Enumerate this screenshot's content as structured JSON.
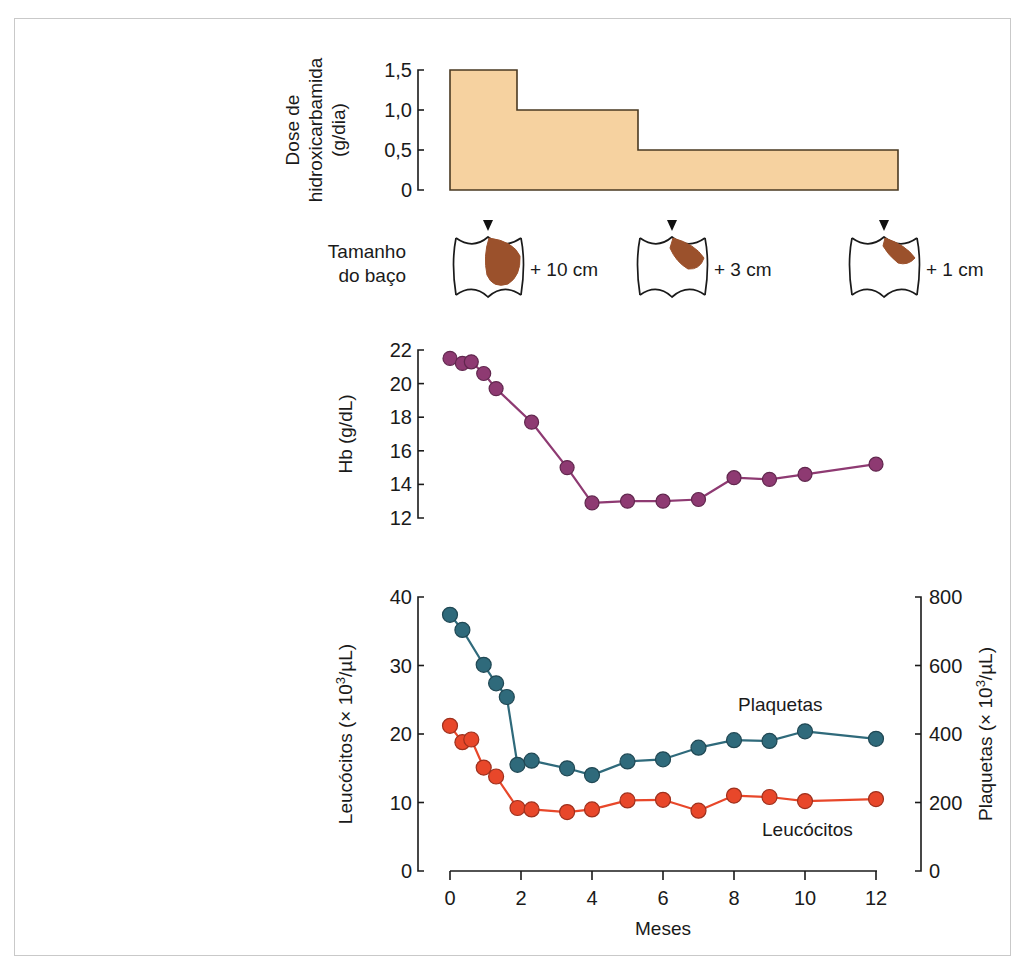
{
  "figure": {
    "x_axis": {
      "label": "Meses",
      "ticks": [
        0,
        2,
        4,
        6,
        8,
        10,
        12
      ],
      "tick_labels": [
        "0",
        "2",
        "4",
        "6",
        "8",
        "10",
        "12"
      ],
      "min": 0,
      "max": 12
    },
    "dose_panel": {
      "axis_label_line1": "Dose de",
      "axis_label_line2": "hidroxicarbamida",
      "axis_label_line3": "(g/dia)",
      "tick_labels": [
        "1,5",
        "1,0",
        "0,5",
        "0"
      ],
      "tick_values": [
        1.5,
        1.0,
        0.5,
        0
      ],
      "fill_color": "#f6d2a0",
      "stroke_color": "#4a3a22",
      "steps": [
        {
          "x_start": 0,
          "x_end": 1.9,
          "dose": 1.5
        },
        {
          "x_start": 1.9,
          "x_end": 5.3,
          "dose": 1.0
        },
        {
          "x_start": 5.3,
          "x_end": 12.6,
          "dose": 0.5
        }
      ]
    },
    "spleen_panel": {
      "label_line1": "Tamanho",
      "label_line2": "do baço",
      "spleen_color": "#9b512c",
      "outline_color": "#1a1a1a",
      "markers": [
        {
          "month": 1.9,
          "size_text": "+ 10 cm",
          "severity": "large"
        },
        {
          "month": 7.2,
          "size_text": "+ 3 cm",
          "severity": "medium"
        },
        {
          "month": 12.0,
          "size_text": "+ 1 cm",
          "severity": "small"
        }
      ]
    },
    "hb_panel": {
      "axis_label": "Hb (g/dL)",
      "tick_labels": [
        "12",
        "14",
        "16",
        "18",
        "20",
        "22"
      ],
      "tick_values": [
        12,
        14,
        16,
        18,
        20,
        22
      ],
      "ymin": 12,
      "ymax": 22,
      "color": "#8e3a72"
    },
    "counts_panel": {
      "left_axis_label_main": "Leucócitos (",
      "left_axis_label_mult": "×",
      "left_axis_label_base": " 10",
      "left_axis_label_exp": "3",
      "left_axis_label_unit": "/µL)",
      "right_axis_label_main": "Plaquetas (",
      "right_axis_label_unit": "/µL)",
      "left_tick_labels": [
        "0",
        "10",
        "20",
        "30",
        "40"
      ],
      "left_tick_values": [
        0,
        10,
        20,
        30,
        40
      ],
      "right_tick_labels": [
        "0",
        "200",
        "400",
        "600",
        "800"
      ],
      "right_tick_values": [
        0,
        200,
        400,
        600,
        800
      ],
      "left_ymin": 0,
      "left_ymax": 40,
      "right_ymin": 0,
      "right_ymax": 800,
      "leucocitos_label": "Leucócitos",
      "plaquetas_label": "Plaquetas",
      "leucocitos_color": "#e8472a",
      "plaquetas_color": "#2f6a7b"
    }
  },
  "chart_data": [
    {
      "type": "area",
      "title": "Dose de hidroxicarbamida (g/dia)",
      "xlabel": "Meses",
      "ylabel": "Dose de hidroxicarbamida (g/dia)",
      "ylim": [
        0,
        1.5
      ],
      "xlim": [
        0,
        12.6
      ],
      "grid": false,
      "step_shape": "post",
      "x": [
        0,
        1.9,
        1.9,
        5.3,
        5.3,
        12.6
      ],
      "values": [
        1.5,
        1.5,
        1.0,
        1.0,
        0.5,
        0.5
      ],
      "tick_labels_y": [
        "0",
        "0,5",
        "1,0",
        "1,5"
      ]
    },
    {
      "type": "scatter",
      "title": "Tamanho do baço",
      "xlabel": "Meses",
      "ylabel": "Tamanho do baço",
      "annotations": [
        "+ 10 cm",
        "+ 3 cm",
        "+ 1 cm"
      ],
      "x": [
        1.9,
        7.2,
        12.0
      ],
      "values": [
        10,
        3,
        1
      ],
      "unit": "cm"
    },
    {
      "type": "line",
      "title": "Hb",
      "xlabel": "Meses",
      "ylabel": "Hb (g/dL)",
      "ylim": [
        12,
        22
      ],
      "xlim": [
        0,
        12
      ],
      "grid": false,
      "legend": null,
      "series": [
        {
          "name": "Hb",
          "color": "#8e3a72",
          "x": [
            0.0,
            0.35,
            0.6,
            0.95,
            1.3,
            2.3,
            3.3,
            4.0,
            5.0,
            6.0,
            7.0,
            8.0,
            9.0,
            10.0,
            12.0
          ],
          "values": [
            21.5,
            21.2,
            21.3,
            20.6,
            19.7,
            17.7,
            15.0,
            12.9,
            13.0,
            13.0,
            13.1,
            14.4,
            14.3,
            14.6,
            15.2
          ]
        }
      ]
    },
    {
      "type": "line",
      "title": "Leucócitos e Plaquetas",
      "xlabel": "Meses",
      "ylabel": "Leucócitos (× 10³/µL)",
      "y2label": "Plaquetas (× 10³/µL)",
      "ylim": [
        0,
        40
      ],
      "y2lim": [
        0,
        800
      ],
      "xlim": [
        0,
        12
      ],
      "grid": false,
      "legend": "inline",
      "series": [
        {
          "name": "Leucócitos",
          "axis": "left",
          "color": "#e8472a",
          "unit": "× 10³/µL",
          "x": [
            0.0,
            0.35,
            0.6,
            0.95,
            1.3,
            1.9,
            2.3,
            3.3,
            4.0,
            5.0,
            6.0,
            7.0,
            8.0,
            9.0,
            10.0,
            12.0
          ],
          "values": [
            21.2,
            18.8,
            19.2,
            15.1,
            13.8,
            9.2,
            9.0,
            8.6,
            9.0,
            10.3,
            10.4,
            8.8,
            11.0,
            10.8,
            10.2,
            10.5
          ]
        },
        {
          "name": "Plaquetas",
          "axis": "right",
          "color": "#2f6a7b",
          "unit": "× 10³/µL",
          "x": [
            0.0,
            0.35,
            0.95,
            1.3,
            1.6,
            1.9,
            2.3,
            3.3,
            4.0,
            5.0,
            6.0,
            7.0,
            8.0,
            9.0,
            10.0,
            12.0
          ],
          "values_left_scale": [
            37.4,
            35.2,
            30.1,
            27.4,
            25.4,
            15.5,
            16.1,
            15.0,
            14.0,
            16.0,
            16.3,
            18.0,
            19.1,
            19.0,
            20.4,
            19.3
          ],
          "values": [
            748,
            704,
            602,
            548,
            508,
            310,
            322,
            300,
            280,
            320,
            326,
            360,
            382,
            380,
            408,
            386
          ]
        }
      ]
    }
  ]
}
